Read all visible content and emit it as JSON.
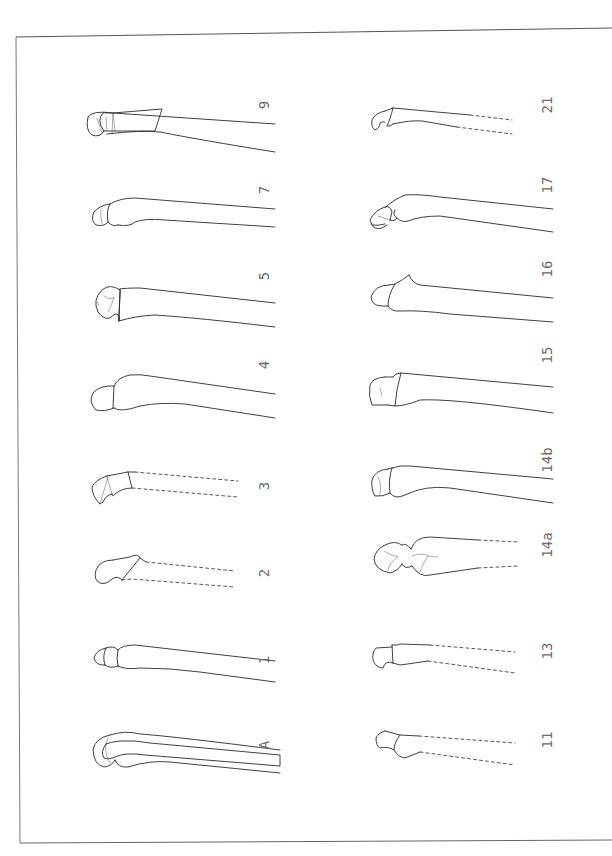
{
  "plate": {
    "border_color": "#555555",
    "line_color": "#2a2a2a",
    "label_color": "#6a6a6a",
    "hatch_color": "#555555"
  },
  "figures": {
    "left_column": [
      {
        "id": "9",
        "label": "9",
        "shaft": "complete"
      },
      {
        "id": "7",
        "label": "7",
        "shaft": "complete"
      },
      {
        "id": "5",
        "label": "5",
        "shaft": "complete"
      },
      {
        "id": "4",
        "label": "4",
        "shaft": "complete"
      },
      {
        "id": "3",
        "label": "3",
        "shaft": "broken-dashed"
      },
      {
        "id": "2",
        "label": "2",
        "shaft": "broken-dashed"
      },
      {
        "id": "1",
        "label": "1",
        "shaft": "complete"
      },
      {
        "id": "A",
        "label": "A",
        "shaft": "complete-hatched-section"
      }
    ],
    "right_column": [
      {
        "id": "21",
        "label": "21",
        "shaft": "broken-dashed"
      },
      {
        "id": "17",
        "label": "17",
        "shaft": "complete"
      },
      {
        "id": "16",
        "label": "16",
        "shaft": "complete"
      },
      {
        "id": "15",
        "label": "15",
        "shaft": "complete"
      },
      {
        "id": "14b",
        "label": "14b",
        "shaft": "complete"
      },
      {
        "id": "14a",
        "label": "14a",
        "shaft": "broken-dashed"
      },
      {
        "id": "13",
        "label": "13",
        "shaft": "broken-dashed"
      },
      {
        "id": "11",
        "label": "11",
        "shaft": "broken-dashed"
      }
    ]
  }
}
